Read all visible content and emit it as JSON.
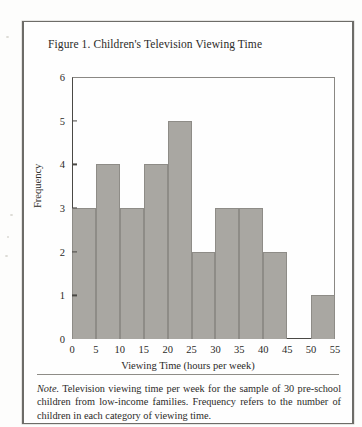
{
  "figure": {
    "title": "Figure 1. Children's Television Viewing Time",
    "note_lead": "Note.",
    "note_body": "Television viewing time per week for the sample of 30 pre-school children from low-income families.  Frequency refers to the number of children in each category of viewing time."
  },
  "chart_data": {
    "type": "bar",
    "title": "Figure 1. Children's Television Viewing Time",
    "xlabel": "Viewing Time (hours per week)",
    "ylabel": "Frequency",
    "categories": [
      "0-5",
      "5-10",
      "10-15",
      "15-20",
      "20-25",
      "25-30",
      "30-35",
      "35-40",
      "40-45",
      "45-50",
      "50-55"
    ],
    "bin_edges": [
      0,
      5,
      10,
      15,
      20,
      25,
      30,
      35,
      40,
      45,
      50,
      55
    ],
    "values": [
      3,
      4,
      3,
      4,
      5,
      2,
      3,
      3,
      2,
      0,
      1
    ],
    "xlim": [
      0,
      55
    ],
    "ylim": [
      0,
      6
    ],
    "xticks": [
      0,
      5,
      10,
      15,
      20,
      25,
      30,
      35,
      40,
      45,
      50,
      55
    ],
    "yticks": [
      0,
      1,
      2,
      3,
      4,
      5,
      6
    ],
    "grid": false,
    "legend": null,
    "bar_color": "#a9a7a2",
    "axis_color": "#4a4945",
    "total": 30
  }
}
